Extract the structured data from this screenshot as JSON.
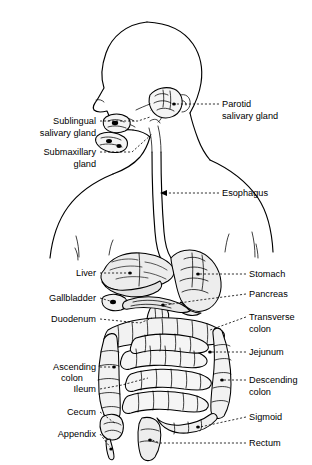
{
  "figure": {
    "view": "left lateral profile of head, neck, thorax and abdomen",
    "background_color": "#ffffff",
    "ink_color": "#000000",
    "leader_style": "dashed"
  },
  "labels": {
    "parotid": {
      "line1": "Parotid",
      "line2": "salivary gland"
    },
    "sublingual": {
      "line1": "Sublingual",
      "line2": "salivary gland"
    },
    "submaxillary": {
      "line1": "Submaxillary",
      "line2": "gland"
    },
    "esophagus": {
      "line1": "Esophagus"
    },
    "liver": {
      "line1": "Liver"
    },
    "gallbladder": {
      "line1": "Gallbladder"
    },
    "duodenum": {
      "line1": "Duodenum"
    },
    "stomach": {
      "line1": "Stomach"
    },
    "pancreas": {
      "line1": "Pancreas"
    },
    "transverse_colon": {
      "line1": "Transverse",
      "line2": "colon"
    },
    "jejunum": {
      "line1": "Jejunum"
    },
    "ascending_colon": {
      "line1": "Ascending",
      "line2": "colon"
    },
    "ileum": {
      "line1": "Ileum"
    },
    "descending_colon": {
      "line1": "Descending",
      "line2": "colon"
    },
    "cecum": {
      "line1": "Cecum"
    },
    "sigmoid": {
      "line1": "Sigmoid"
    },
    "appendix": {
      "line1": "Appendix"
    },
    "rectum": {
      "line1": "Rectum"
    }
  },
  "label_positions": {
    "parotid": {
      "x": 222,
      "y": 107,
      "side": "right"
    },
    "sublingual": {
      "x": 96,
      "y": 124,
      "side": "left"
    },
    "submaxillary": {
      "x": 96,
      "y": 155,
      "side": "left"
    },
    "esophagus": {
      "x": 222,
      "y": 196,
      "side": "right"
    },
    "liver": {
      "x": 96,
      "y": 276,
      "side": "left"
    },
    "gallbladder": {
      "x": 96,
      "y": 301,
      "side": "left"
    },
    "duodenum": {
      "x": 96,
      "y": 322,
      "side": "left"
    },
    "stomach": {
      "x": 249,
      "y": 277,
      "side": "right"
    },
    "pancreas": {
      "x": 249,
      "y": 297,
      "side": "right"
    },
    "transverse_colon": {
      "x": 249,
      "y": 320,
      "side": "right"
    },
    "jejunum": {
      "x": 249,
      "y": 355,
      "side": "right"
    },
    "ascending_colon": {
      "x": 96,
      "y": 370,
      "side": "left"
    },
    "ileum": {
      "x": 96,
      "y": 392,
      "side": "left"
    },
    "descending_colon": {
      "x": 249,
      "y": 383,
      "side": "right"
    },
    "cecum": {
      "x": 96,
      "y": 415,
      "side": "left"
    },
    "sigmoid": {
      "x": 249,
      "y": 420,
      "side": "right"
    },
    "appendix": {
      "x": 96,
      "y": 437,
      "side": "left"
    },
    "rectum": {
      "x": 249,
      "y": 446,
      "side": "right"
    }
  }
}
